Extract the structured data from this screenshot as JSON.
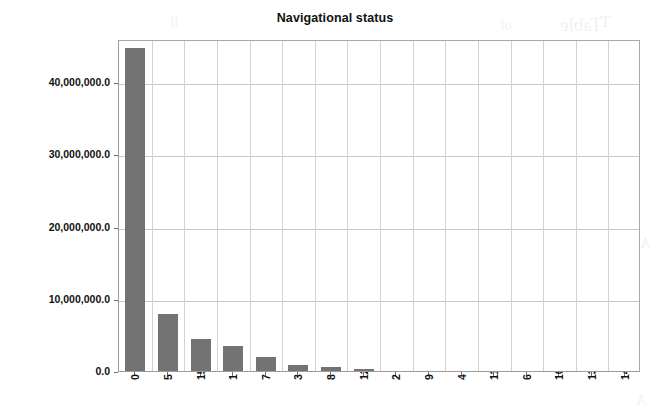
{
  "chart_data": {
    "type": "bar",
    "title": "Navigational status",
    "xlabel": "",
    "ylabel": "",
    "categories": [
      "0",
      "5",
      "15",
      "1",
      "7",
      "3",
      "8",
      "12",
      "2",
      "9",
      "4",
      "11",
      "6",
      "10",
      "13",
      "14"
    ],
    "values": [
      44800000,
      7900000,
      4500000,
      3400000,
      1900000,
      900000,
      600000,
      250000,
      60000,
      40000,
      30000,
      20000,
      15000,
      10000,
      5000,
      3000
    ],
    "ylim": [
      0,
      46000000
    ],
    "ytick_values": [
      0,
      10000000,
      20000000,
      30000000,
      40000000
    ],
    "ytick_labels": [
      "0.0",
      "10,000,000.0",
      "20,000,000.0",
      "30,000,000.0",
      "40,000,000.0"
    ],
    "grid": true,
    "grid_axis": "both",
    "legend": false,
    "bar_color": "#737373",
    "plot_border_color": "#9b9b9b",
    "gridline_color": "#c8c8c8"
  },
  "background_ghost_text": [
    {
      "text": "Table",
      "x": 560,
      "y": 14,
      "size": 19
    },
    {
      "text": "of",
      "x": 500,
      "y": 18,
      "size": 14
    },
    {
      "text": "ll",
      "x": 170,
      "y": 14,
      "size": 15
    },
    {
      "text": "T",
      "x": 600,
      "y": 12,
      "size": 17
    },
    {
      "text": "C",
      "x": 212,
      "y": 128,
      "size": 13
    },
    {
      "text": "Table",
      "x": 570,
      "y": 196,
      "size": 18
    },
    {
      "text": "A",
      "x": 640,
      "y": 236,
      "size": 14
    },
    {
      "text": "C",
      "x": 372,
      "y": 126,
      "size": 13
    },
    {
      "text": "d",
      "x": 408,
      "y": 240,
      "size": 12
    },
    {
      "text": "A",
      "x": 636,
      "y": 392,
      "size": 15
    }
  ]
}
